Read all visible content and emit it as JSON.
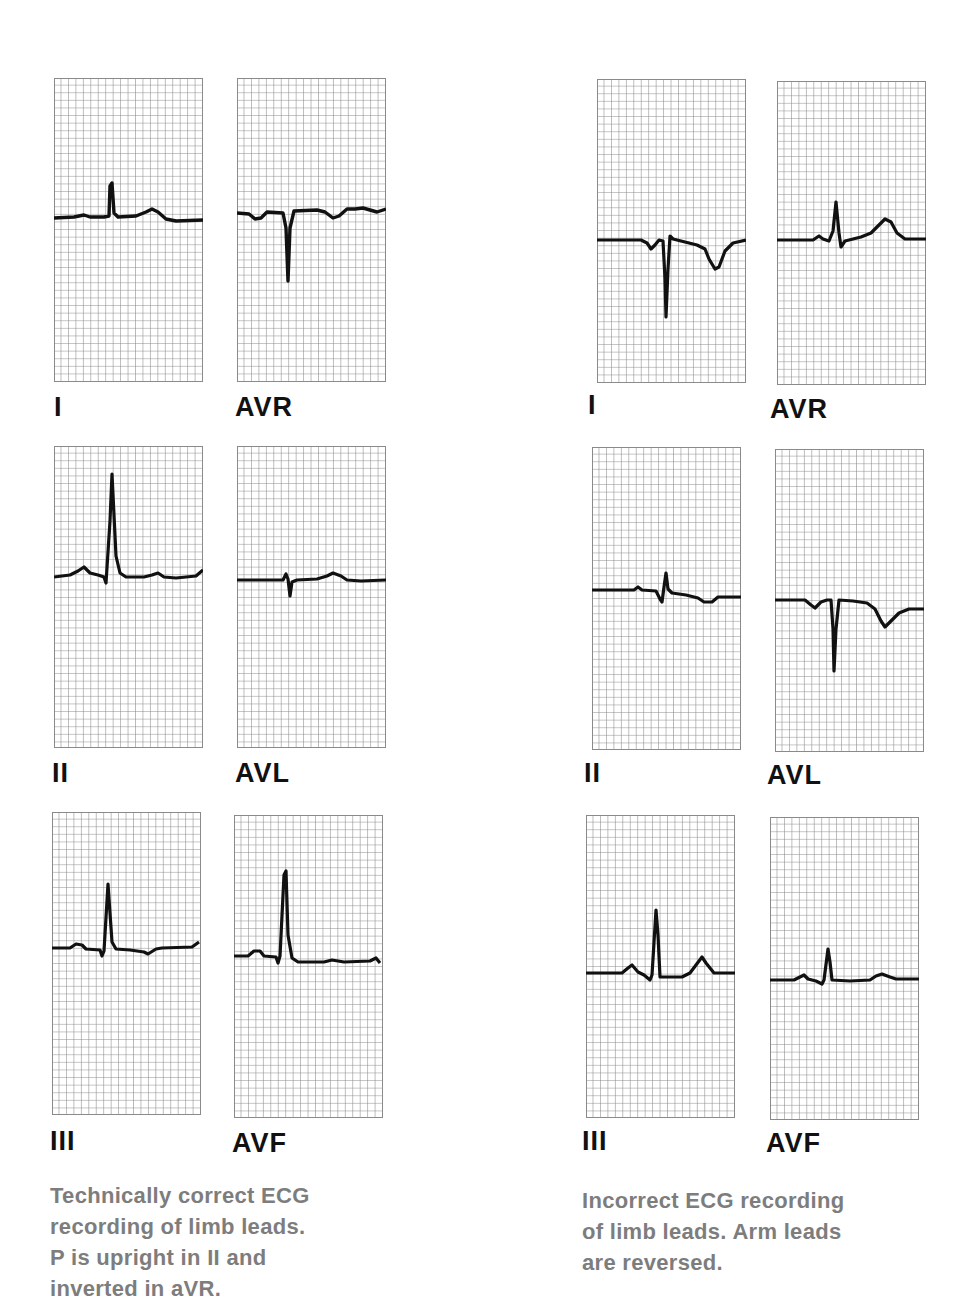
{
  "figure": {
    "left": {
      "caption_lines": [
        "Technically correct ECG",
        "recording of limb leads.",
        "P is upright in II and",
        "inverted in aVR."
      ],
      "panels": [
        {
          "label": "I",
          "lead": "I"
        },
        {
          "label": "AVR",
          "lead": "aVR"
        },
        {
          "label": "II",
          "lead": "II"
        },
        {
          "label": "AVL",
          "lead": "aVL"
        },
        {
          "label": "III",
          "lead": "III"
        },
        {
          "label": "AVF",
          "lead": "aVF"
        }
      ]
    },
    "right": {
      "caption_lines": [
        "Incorrect ECG recording",
        "of limb leads. Arm leads",
        "are reversed."
      ],
      "panels": [
        {
          "label": "I",
          "lead": "I"
        },
        {
          "label": "AVR",
          "lead": "aVR"
        },
        {
          "label": "II",
          "lead": "II"
        },
        {
          "label": "AVL",
          "lead": "aVL"
        },
        {
          "label": "III",
          "lead": "III"
        },
        {
          "label": "AVF",
          "lead": "aVF"
        }
      ]
    },
    "colors": {
      "grid": "#8a8a8a",
      "trace": "#111111",
      "label": "#111111",
      "caption": "#7d7d7d"
    }
  }
}
